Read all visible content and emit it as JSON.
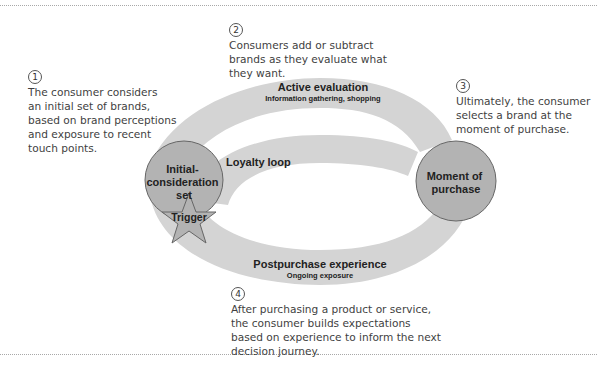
{
  "callouts": [
    {
      "number": "1",
      "text": "The consumer considers\nan initial set of brands,\nbased on brand perceptions\nand exposure to recent\ntouch points."
    },
    {
      "number": "2",
      "text": "Consumers add or subtract\nbrands as they evaluate what\nthey want."
    },
    {
      "number": "3",
      "text": "Ultimately, the consumer\nselects a brand at the\nmoment of purchase."
    },
    {
      "number": "4",
      "text": "After purchasing a product or service,\nthe consumer builds expectations\nbased on experience to inform the next\ndecision journey."
    }
  ],
  "stages": {
    "active_evaluation": {
      "title": "Active evaluation",
      "subtitle": "Information gathering, shopping"
    },
    "postpurchase": {
      "title": "Postpurchase experience",
      "subtitle": "Ongoing exposure"
    },
    "loyalty_loop": {
      "title": "Loyalty loop"
    }
  },
  "nodes": {
    "initial_set": {
      "line1": "Initial-",
      "line2": "consideration",
      "line3": "set"
    },
    "moment_of_purchase": {
      "line1": "Moment of",
      "line2": "purchase"
    },
    "trigger": {
      "label": "Trigger"
    }
  },
  "colors": {
    "band": "#d4d4d4",
    "node_fill": "#b3b3b3",
    "node_stroke": "#666666",
    "text": "#3f3f3f",
    "divider": "#a8a8a8"
  }
}
